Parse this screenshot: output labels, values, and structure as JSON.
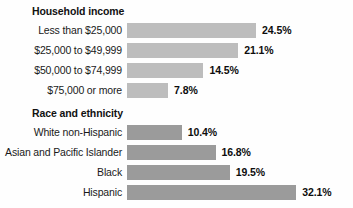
{
  "chart_data": {
    "type": "bar",
    "title": "",
    "xlabel": "",
    "ylabel": "",
    "orientation": "horizontal",
    "value_suffix": "%",
    "grid": false,
    "legend": "none",
    "xlim": [
      0,
      35
    ],
    "groups": [
      {
        "title": "Household income",
        "bar_color": "#bdbdbd",
        "categories": [
          "Less than $25,000",
          "$25,000 to $49,999",
          "$50,000 to $74,999",
          "$75,000 or more"
        ],
        "values": [
          24.5,
          21.1,
          14.5,
          7.8
        ],
        "value_labels": [
          "24.5%",
          "21.1%",
          "14.5%",
          "7.8%"
        ]
      },
      {
        "title": "Race and ethnicity",
        "bar_color": "#9b9b9b",
        "categories": [
          "White non-Hispanic",
          "Asian and Pacific Islander",
          "Black",
          "Hispanic"
        ],
        "values": [
          10.4,
          16.8,
          19.5,
          32.1
        ],
        "value_labels": [
          "10.4%",
          "16.8%",
          "19.5%",
          "32.1%"
        ]
      }
    ]
  },
  "layout": {
    "bar_origin_px": 127,
    "px_per_percent": 5.27,
    "value_gap_px": 6
  }
}
